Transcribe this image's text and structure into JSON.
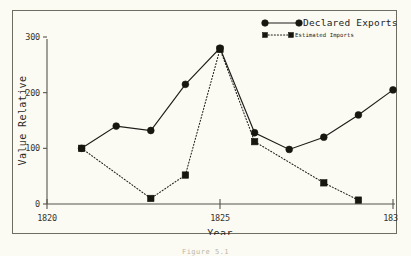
{
  "figure": {
    "caption_partial": "Figure 5.1"
  },
  "chart_data": {
    "type": "line",
    "title": "",
    "xlabel": "Year",
    "ylabel": "Value Relative",
    "xlim": [
      1820,
      1830
    ],
    "ylim": [
      0,
      300
    ],
    "xticks": [
      1820,
      1825,
      1830
    ],
    "xticklabels": [
      "1820",
      "1825",
      "1830"
    ],
    "yticks": [
      0,
      100,
      200,
      300
    ],
    "yticklabels": [
      "0",
      "100",
      "200",
      "300"
    ],
    "grid": false,
    "legend_position": "top-right",
    "series": [
      {
        "name": "Declared Exports",
        "marker": "circle",
        "linestyle": "solid",
        "x": [
          1821,
          1822,
          1823,
          1824,
          1825,
          1826,
          1827,
          1828,
          1829,
          1830
        ],
        "values": [
          100,
          140,
          132,
          215,
          280,
          128,
          98,
          120,
          160,
          205
        ]
      },
      {
        "name": "Estimated Imports",
        "marker": "square",
        "linestyle": "dotted",
        "x": [
          1821,
          1823,
          1824,
          1825,
          1826,
          1828,
          1829
        ],
        "values": [
          100,
          10,
          52,
          278,
          112,
          38,
          7
        ]
      }
    ]
  }
}
